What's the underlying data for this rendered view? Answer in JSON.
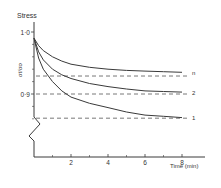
{
  "chart_data": {
    "type": "line",
    "title": "",
    "ylabel_top": "Stress",
    "ylabel_side": "σt / σo",
    "xlabel": "Time (min)",
    "xlim": [
      0,
      9.5
    ],
    "ylim_visible": [
      0.855,
      1.0
    ],
    "y_axis_break": true,
    "grid": false,
    "x_ticks": [
      {
        "value": 2,
        "label": "2"
      },
      {
        "value": 4,
        "label": "4"
      },
      {
        "value": 6,
        "label": "6"
      },
      {
        "value": 8,
        "label": "8"
      }
    ],
    "x_minor_ticks": [
      1,
      3,
      5,
      7
    ],
    "y_ticks": [
      {
        "value": 1.0,
        "label": "1·0"
      },
      {
        "value": 0.9,
        "label": "0·9"
      }
    ],
    "y_minor_ticks": [
      0.98,
      0.96,
      0.94,
      0.92,
      0.88,
      0.86
    ],
    "x": [
      0,
      0.25,
      0.5,
      1,
      1.5,
      2,
      3,
      4,
      5,
      6,
      7,
      8
    ],
    "series": [
      {
        "name": "n",
        "label": "n",
        "asymptote": 0.929,
        "values": [
          0.99,
          0.978,
          0.97,
          0.96,
          0.953,
          0.948,
          0.943,
          0.94,
          0.938,
          0.937,
          0.936,
          0.935
        ]
      },
      {
        "name": "2",
        "label": "2",
        "asymptote": 0.9,
        "values": [
          0.99,
          0.968,
          0.955,
          0.94,
          0.931,
          0.925,
          0.917,
          0.912,
          0.908,
          0.905,
          0.904,
          0.903
        ]
      },
      {
        "name": "1",
        "label": "1",
        "asymptote": 0.861,
        "values": [
          0.99,
          0.958,
          0.94,
          0.92,
          0.905,
          0.895,
          0.885,
          0.878,
          0.871,
          0.866,
          0.864,
          0.862
        ]
      }
    ]
  }
}
